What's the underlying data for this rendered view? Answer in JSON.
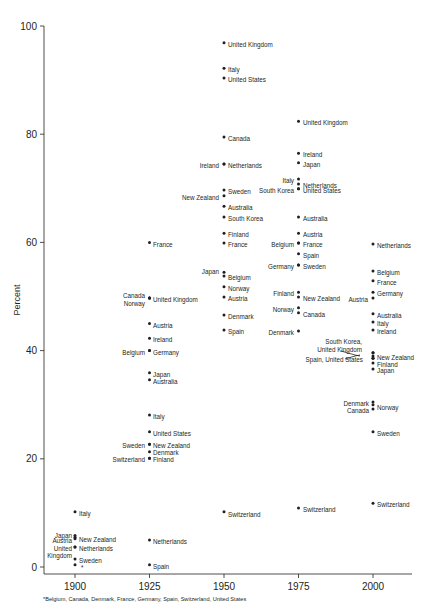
{
  "chart_data": {
    "type": "scatter",
    "title": "",
    "xlabel": "",
    "ylabel": "Percent",
    "xlim": [
      1890,
      2015
    ],
    "ylim": [
      0,
      100
    ],
    "x_ticks": [
      1900,
      1925,
      1950,
      1975,
      2000
    ],
    "y_ticks": [
      0,
      20,
      40,
      60,
      80,
      100
    ],
    "grid": false,
    "legend": "none",
    "footnote": "*Belgium, Canada, Denmark, France, Germany, Spain, Switzerland, United States",
    "points": [
      {
        "x": 1900,
        "y": 10.2,
        "label": "Italy",
        "side": "right"
      },
      {
        "x": 1900,
        "y": 5.8,
        "label": "Japan",
        "side": "left"
      },
      {
        "x": 1900,
        "y": 5.2,
        "label": "Austria",
        "side": "left"
      },
      {
        "x": 1900,
        "y": 5.5,
        "label": "New Zealand",
        "side": "right"
      },
      {
        "x": 1900,
        "y": 3.7,
        "label": "United Kingdom",
        "side": "left"
      },
      {
        "x": 1900,
        "y": 3.7,
        "label": "Netherlands",
        "side": "right"
      },
      {
        "x": 1900,
        "y": 1.5,
        "label": "Sweden",
        "side": "right"
      },
      {
        "x": 1900,
        "y": 0.4,
        "label": "*",
        "side": "right"
      },
      {
        "x": 1925,
        "y": 60.0,
        "label": "France",
        "side": "right"
      },
      {
        "x": 1925,
        "y": 49.7,
        "label": "Canada",
        "side": "left"
      },
      {
        "x": 1925,
        "y": 49.7,
        "label": "Norway",
        "side": "left"
      },
      {
        "x": 1925,
        "y": 49.7,
        "label": "United Kingdom",
        "side": "right"
      },
      {
        "x": 1925,
        "y": 45.0,
        "label": "Austria",
        "side": "right"
      },
      {
        "x": 1925,
        "y": 42.3,
        "label": "Ireland",
        "side": "right"
      },
      {
        "x": 1925,
        "y": 40.0,
        "label": "Belgium",
        "side": "left"
      },
      {
        "x": 1925,
        "y": 40.0,
        "label": "Germany",
        "side": "right"
      },
      {
        "x": 1925,
        "y": 35.9,
        "label": "Japan",
        "side": "right"
      },
      {
        "x": 1925,
        "y": 34.6,
        "label": "Australia",
        "side": "right"
      },
      {
        "x": 1925,
        "y": 28.1,
        "label": "Italy",
        "side": "right"
      },
      {
        "x": 1925,
        "y": 25.0,
        "label": "United States",
        "side": "right"
      },
      {
        "x": 1925,
        "y": 22.7,
        "label": "Sweden",
        "side": "left"
      },
      {
        "x": 1925,
        "y": 22.7,
        "label": "New Zealand",
        "side": "right"
      },
      {
        "x": 1925,
        "y": 21.3,
        "label": "Denmark",
        "side": "right"
      },
      {
        "x": 1925,
        "y": 20.1,
        "label": "Switzerland",
        "side": "left"
      },
      {
        "x": 1925,
        "y": 20.1,
        "label": "Finland",
        "side": "right"
      },
      {
        "x": 1925,
        "y": 5.0,
        "label": "Netherlands",
        "side": "right"
      },
      {
        "x": 1925,
        "y": 0.4,
        "label": "Spain",
        "side": "right"
      },
      {
        "x": 1950,
        "y": 96.9,
        "label": "United Kingdom",
        "side": "right"
      },
      {
        "x": 1950,
        "y": 92.2,
        "label": "Italy",
        "side": "right"
      },
      {
        "x": 1950,
        "y": 90.4,
        "label": "United States",
        "side": "right"
      },
      {
        "x": 1950,
        "y": 79.5,
        "label": "Canada",
        "side": "right"
      },
      {
        "x": 1950,
        "y": 74.5,
        "label": "Ireland",
        "side": "left"
      },
      {
        "x": 1950,
        "y": 74.5,
        "label": "Netherlands",
        "side": "right"
      },
      {
        "x": 1950,
        "y": 69.7,
        "label": "Sweden",
        "side": "right"
      },
      {
        "x": 1950,
        "y": 68.6,
        "label": "New Zealand",
        "side": "left"
      },
      {
        "x": 1950,
        "y": 66.7,
        "label": "Australia",
        "side": "right"
      },
      {
        "x": 1950,
        "y": 64.7,
        "label": "South Korea",
        "side": "right"
      },
      {
        "x": 1950,
        "y": 61.7,
        "label": "Finland",
        "side": "right"
      },
      {
        "x": 1950,
        "y": 59.9,
        "label": "France",
        "side": "right"
      },
      {
        "x": 1950,
        "y": 54.5,
        "label": "Japan",
        "side": "left"
      },
      {
        "x": 1950,
        "y": 53.8,
        "label": "Belgium",
        "side": "right"
      },
      {
        "x": 1950,
        "y": 51.8,
        "label": "Norway",
        "side": "right"
      },
      {
        "x": 1950,
        "y": 49.9,
        "label": "Austria",
        "side": "right"
      },
      {
        "x": 1950,
        "y": 46.6,
        "label": "Denmark",
        "side": "right"
      },
      {
        "x": 1950,
        "y": 43.8,
        "label": "Spain",
        "side": "right"
      },
      {
        "x": 1950,
        "y": 10.2,
        "label": "Switzerland",
        "side": "right"
      },
      {
        "x": 1975,
        "y": 82.4,
        "label": "United Kingdom",
        "side": "right"
      },
      {
        "x": 1975,
        "y": 76.5,
        "label": "Ireland",
        "side": "right"
      },
      {
        "x": 1975,
        "y": 74.7,
        "label": "Japan",
        "side": "right"
      },
      {
        "x": 1975,
        "y": 71.7,
        "label": "Italy",
        "side": "left"
      },
      {
        "x": 1975,
        "y": 70.8,
        "label": "Netherlands",
        "side": "right"
      },
      {
        "x": 1975,
        "y": 69.9,
        "label": "South Korea",
        "side": "left"
      },
      {
        "x": 1975,
        "y": 69.9,
        "label": "United States",
        "side": "right"
      },
      {
        "x": 1975,
        "y": 64.7,
        "label": "Australia",
        "side": "right"
      },
      {
        "x": 1975,
        "y": 61.7,
        "label": "Austria",
        "side": "right"
      },
      {
        "x": 1975,
        "y": 59.9,
        "label": "Belgium",
        "side": "left"
      },
      {
        "x": 1975,
        "y": 59.9,
        "label": "France",
        "side": "right"
      },
      {
        "x": 1975,
        "y": 57.9,
        "label": "Spain",
        "side": "right"
      },
      {
        "x": 1975,
        "y": 55.8,
        "label": "Germany",
        "side": "left"
      },
      {
        "x": 1975,
        "y": 55.8,
        "label": "Sweden",
        "side": "right"
      },
      {
        "x": 1975,
        "y": 50.8,
        "label": "Finland",
        "side": "left"
      },
      {
        "x": 1975,
        "y": 49.9,
        "label": "New Zealand",
        "side": "right"
      },
      {
        "x": 1975,
        "y": 47.9,
        "label": "Norway",
        "side": "left"
      },
      {
        "x": 1975,
        "y": 47.0,
        "label": "Canada",
        "side": "right"
      },
      {
        "x": 1975,
        "y": 43.6,
        "label": "Denmark",
        "side": "left"
      },
      {
        "x": 1975,
        "y": 10.9,
        "label": "Switzerland",
        "side": "right"
      },
      {
        "x": 2000,
        "y": 59.7,
        "label": "Netherlands",
        "side": "right"
      },
      {
        "x": 2000,
        "y": 54.7,
        "label": "Belgium",
        "side": "right"
      },
      {
        "x": 2000,
        "y": 52.9,
        "label": "France",
        "side": "right"
      },
      {
        "x": 2000,
        "y": 50.8,
        "label": "Germany",
        "side": "right"
      },
      {
        "x": 2000,
        "y": 49.7,
        "label": "Austria",
        "side": "left"
      },
      {
        "x": 2000,
        "y": 46.8,
        "label": "Australia",
        "side": "right"
      },
      {
        "x": 2000,
        "y": 45.3,
        "label": "Italy",
        "side": "right"
      },
      {
        "x": 2000,
        "y": 43.8,
        "label": "Ireland",
        "side": "right"
      },
      {
        "x": 2000,
        "y": 39.6,
        "label": "South Korea",
        "side": "left"
      },
      {
        "x": 2000,
        "y": 39.6,
        "label": "United Kingdom",
        "side": "left"
      },
      {
        "x": 2000,
        "y": 39.0,
        "label": "New Zealand",
        "side": "right"
      },
      {
        "x": 2000,
        "y": 38.6,
        "label": "Spain",
        "side": "left"
      },
      {
        "x": 2000,
        "y": 38.6,
        "label": "United States",
        "side": "left"
      },
      {
        "x": 2000,
        "y": 37.7,
        "label": "Finland",
        "side": "right"
      },
      {
        "x": 2000,
        "y": 36.6,
        "label": "Japan",
        "side": "right"
      },
      {
        "x": 2000,
        "y": 30.5,
        "label": "Denmark",
        "side": "left"
      },
      {
        "x": 2000,
        "y": 30.0,
        "label": "Norway",
        "side": "right"
      },
      {
        "x": 2000,
        "y": 29.2,
        "label": "Canada",
        "side": "left"
      },
      {
        "x": 2000,
        "y": 25.0,
        "label": "Sweden",
        "side": "right"
      },
      {
        "x": 2000,
        "y": 11.8,
        "label": "Switzerland",
        "side": "right"
      }
    ],
    "annotations": [
      {
        "x": 2000,
        "text": "South Korea, United Kingdom",
        "pointer": "leader line"
      },
      {
        "x": 2000,
        "text": "Spain, United States",
        "pointer": "leader line"
      }
    ]
  },
  "labels": [
    {
      "text": "United Kingdom",
      "x": 228,
      "y": 45
    },
    {
      "text": "Italy",
      "x": 228,
      "y": 70
    },
    {
      "text": "United States",
      "x": 228,
      "y": 80
    },
    {
      "text": "Canada",
      "x": 228,
      "y": 139
    },
    {
      "text": "Netherlands",
      "x": 228,
      "y": 166
    },
    {
      "text": "Ireland",
      "x": 219,
      "y": 166,
      "anchor": "end"
    },
    {
      "text": "Sweden",
      "x": 228,
      "y": 192
    },
    {
      "text": "New Zealand",
      "x": 219,
      "y": 198,
      "anchor": "end"
    },
    {
      "text": "Australia",
      "x": 228,
      "y": 208
    },
    {
      "text": "South Korea",
      "x": 228,
      "y": 219
    },
    {
      "text": "Finland",
      "x": 228,
      "y": 235
    },
    {
      "text": "France",
      "x": 228,
      "y": 245
    },
    {
      "text": "Japan",
      "x": 219,
      "y": 272,
      "anchor": "end"
    },
    {
      "text": "Belgium",
      "x": 228,
      "y": 278
    },
    {
      "text": "Norway",
      "x": 228,
      "y": 289
    },
    {
      "text": "Austria",
      "x": 228,
      "y": 299
    },
    {
      "text": "Denmark",
      "x": 228,
      "y": 317
    },
    {
      "text": "Spain",
      "x": 228,
      "y": 332
    },
    {
      "text": "Switzerland",
      "x": 228,
      "y": 515
    },
    {
      "text": "United Kingdom",
      "x": 303,
      "y": 123
    },
    {
      "text": "Ireland",
      "x": 303,
      "y": 155
    },
    {
      "text": "Japan",
      "x": 303,
      "y": 165
    },
    {
      "text": "Italy",
      "x": 294,
      "y": 181,
      "anchor": "end"
    },
    {
      "text": "Netherlands",
      "x": 303,
      "y": 186
    },
    {
      "text": "South Korea",
      "x": 294,
      "y": 191,
      "anchor": "end"
    },
    {
      "text": "United States",
      "x": 303,
      "y": 191
    },
    {
      "text": "Australia",
      "x": 303,
      "y": 219
    },
    {
      "text": "Austria",
      "x": 303,
      "y": 235
    },
    {
      "text": "Belgium",
      "x": 294,
      "y": 245,
      "anchor": "end"
    },
    {
      "text": "France",
      "x": 303,
      "y": 245
    },
    {
      "text": "Spain",
      "x": 303,
      "y": 256
    },
    {
      "text": "Germany",
      "x": 294,
      "y": 267,
      "anchor": "end"
    },
    {
      "text": "Sweden",
      "x": 303,
      "y": 267
    },
    {
      "text": "Finland",
      "x": 294,
      "y": 294,
      "anchor": "end"
    },
    {
      "text": "New Zealand",
      "x": 303,
      "y": 299
    },
    {
      "text": "Norway",
      "x": 294,
      "y": 310,
      "anchor": "end"
    },
    {
      "text": "Canada",
      "x": 303,
      "y": 315
    },
    {
      "text": "Denmark",
      "x": 294,
      "y": 333,
      "anchor": "end"
    },
    {
      "text": "Switzerland",
      "x": 303,
      "y": 510
    },
    {
      "text": "Netherlands",
      "x": 377,
      "y": 246
    },
    {
      "text": "Belgium",
      "x": 377,
      "y": 273
    },
    {
      "text": "France",
      "x": 377,
      "y": 283
    },
    {
      "text": "Germany",
      "x": 377,
      "y": 294
    },
    {
      "text": "Austria",
      "x": 368,
      "y": 300,
      "anchor": "end"
    },
    {
      "text": "Australia",
      "x": 377,
      "y": 316
    },
    {
      "text": "Italy",
      "x": 377,
      "y": 324
    },
    {
      "text": "Ireland",
      "x": 377,
      "y": 332
    },
    {
      "text": "South Korea,",
      "x": 362,
      "y": 342,
      "anchor": "end"
    },
    {
      "text": "United Kingdom",
      "x": 362,
      "y": 350,
      "anchor": "end"
    },
    {
      "text": "Spain, United States",
      "x": 363,
      "y": 360,
      "anchor": "end"
    },
    {
      "text": "New Zealand",
      "x": 377,
      "y": 358
    },
    {
      "text": "Finland",
      "x": 377,
      "y": 365
    },
    {
      "text": "Japan",
      "x": 377,
      "y": 371
    },
    {
      "text": "Denmark",
      "x": 369,
      "y": 404,
      "anchor": "end"
    },
    {
      "text": "Norway",
      "x": 377,
      "y": 408
    },
    {
      "text": "Canada",
      "x": 369,
      "y": 411,
      "anchor": "end"
    },
    {
      "text": "Sweden",
      "x": 377,
      "y": 434
    },
    {
      "text": "Switzerland",
      "x": 377,
      "y": 505
    },
    {
      "text": "France",
      "x": 153,
      "y": 245
    },
    {
      "text": "Canada",
      "x": 145,
      "y": 296,
      "anchor": "end"
    },
    {
      "text": "Norway",
      "x": 145,
      "y": 304,
      "anchor": "end"
    },
    {
      "text": "United Kingdom",
      "x": 153,
      "y": 300
    },
    {
      "text": "Austria",
      "x": 153,
      "y": 326
    },
    {
      "text": "Ireland",
      "x": 153,
      "y": 340
    },
    {
      "text": "Belgium",
      "x": 145,
      "y": 353,
      "anchor": "end"
    },
    {
      "text": "Germany",
      "x": 153,
      "y": 353
    },
    {
      "text": "Japan",
      "x": 153,
      "y": 375
    },
    {
      "text": "Australia",
      "x": 153,
      "y": 382
    },
    {
      "text": "Italy",
      "x": 153,
      "y": 417
    },
    {
      "text": "United States",
      "x": 153,
      "y": 434
    },
    {
      "text": "Sweden",
      "x": 145,
      "y": 446,
      "anchor": "end"
    },
    {
      "text": "New Zealand",
      "x": 153,
      "y": 446
    },
    {
      "text": "Denmark",
      "x": 153,
      "y": 453
    },
    {
      "text": "Switzerland",
      "x": 145,
      "y": 460,
      "anchor": "end"
    },
    {
      "text": "Finland",
      "x": 153,
      "y": 460
    },
    {
      "text": "Netherlands",
      "x": 153,
      "y": 542
    },
    {
      "text": "Spain",
      "x": 153,
      "y": 567
    },
    {
      "text": "Italy",
      "x": 79,
      "y": 514
    },
    {
      "text": "Japan",
      "x": 72,
      "y": 536,
      "anchor": "end"
    },
    {
      "text": "Austria",
      "x": 72,
      "y": 541,
      "anchor": "end"
    },
    {
      "text": "New Zealand",
      "x": 79,
      "y": 540
    },
    {
      "text": "United",
      "x": 72,
      "y": 549,
      "anchor": "end"
    },
    {
      "text": "Kingdom",
      "x": 72,
      "y": 556,
      "anchor": "end"
    },
    {
      "text": "Netherlands",
      "x": 79,
      "y": 549
    },
    {
      "text": "Sweden",
      "x": 79,
      "y": 561
    },
    {
      "text": "*",
      "x": 81,
      "y": 568
    }
  ]
}
